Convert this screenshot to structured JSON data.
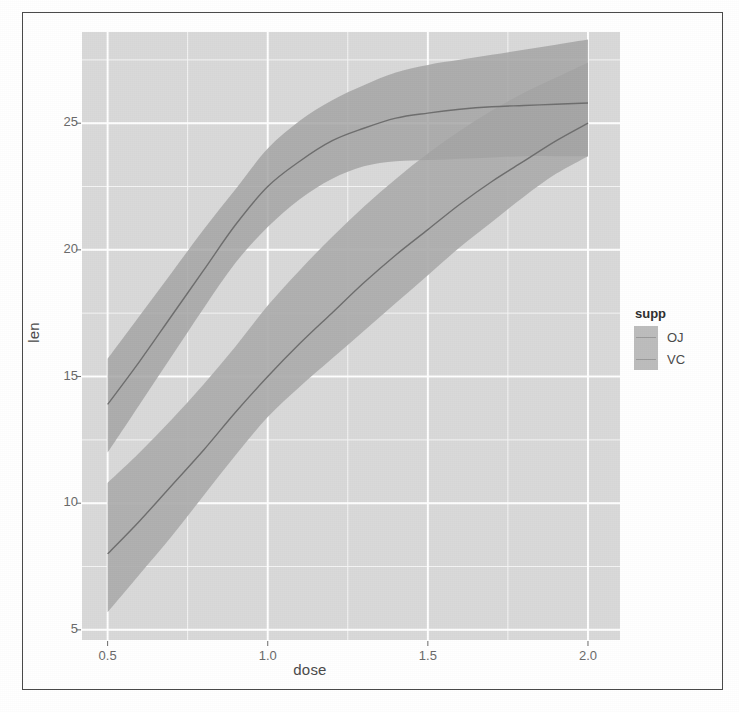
{
  "figure": {
    "panel_bg": "#d9d9d9",
    "grid_color": "#ffffff",
    "ribbon_color": "#a8a8a8",
    "line_color": "#6b6b6b",
    "border_color": "#4a4a4a"
  },
  "legend": {
    "title": "supp",
    "items": [
      {
        "label": "OJ",
        "key_color": "#b5b5b5"
      },
      {
        "label": "VC",
        "key_color": "#b0b0b0"
      }
    ]
  },
  "chart_data": {
    "type": "line",
    "title": "",
    "xlabel": "dose",
    "ylabel": "len",
    "xlim": [
      0.42,
      2.1
    ],
    "ylim": [
      4.6,
      28.6
    ],
    "xticks": [
      0.5,
      1.0,
      1.5,
      2.0
    ],
    "xtick_labels": [
      "0.5",
      "1.0",
      "1.5",
      "2.0"
    ],
    "yticks": [
      5,
      10,
      15,
      20,
      25
    ],
    "ytick_labels": [
      "5",
      "10",
      "15",
      "20",
      "25"
    ],
    "grid": "major and minor white gridlines on grey panel",
    "legend_position": "right",
    "legend_title": "supp",
    "ribbon": "95% confidence interval (loess smooth)",
    "x": [
      0.5,
      0.6,
      0.7,
      0.8,
      0.9,
      1.0,
      1.1,
      1.2,
      1.3,
      1.4,
      1.5,
      1.6,
      1.7,
      1.8,
      1.9,
      2.0
    ],
    "series": [
      {
        "name": "OJ",
        "values": [
          13.9,
          15.6,
          17.4,
          19.2,
          21.0,
          22.5,
          23.5,
          24.3,
          24.8,
          25.2,
          25.4,
          25.55,
          25.65,
          25.7,
          25.75,
          25.8
        ],
        "ci_lower": [
          12.0,
          13.9,
          15.8,
          17.7,
          19.5,
          20.9,
          22.0,
          22.8,
          23.3,
          23.5,
          23.55,
          23.6,
          23.65,
          23.7,
          23.7,
          23.7
        ],
        "ci_upper": [
          15.7,
          17.4,
          19.1,
          20.8,
          22.4,
          24.0,
          25.1,
          25.9,
          26.5,
          27.0,
          27.3,
          27.5,
          27.7,
          27.9,
          28.1,
          28.3
        ]
      },
      {
        "name": "VC",
        "values": [
          8.0,
          9.3,
          10.7,
          12.1,
          13.6,
          15.0,
          16.3,
          17.5,
          18.7,
          19.8,
          20.8,
          21.8,
          22.7,
          23.5,
          24.3,
          25.0
        ],
        "ci_lower": [
          5.7,
          7.2,
          8.7,
          10.3,
          11.9,
          13.4,
          14.6,
          15.7,
          16.8,
          17.9,
          19.0,
          20.1,
          21.1,
          22.1,
          23.0,
          23.7
        ],
        "ci_upper": [
          10.8,
          12.0,
          13.3,
          14.7,
          16.2,
          17.8,
          19.2,
          20.5,
          21.7,
          22.8,
          23.8,
          24.7,
          25.5,
          26.2,
          26.8,
          27.4
        ]
      }
    ]
  }
}
